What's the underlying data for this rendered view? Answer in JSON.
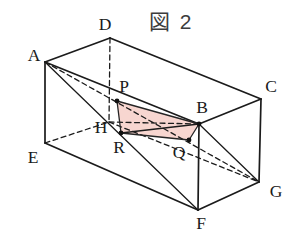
{
  "figure": {
    "title": "図 2"
  },
  "colors": {
    "background": "#ffffff",
    "line": "#1b1b1b",
    "label": "#1a1a1a",
    "title_color": "#3c3c3c",
    "section_fill": "#f6d2cb",
    "section_stroke": "#252525",
    "dot": "#111111"
  },
  "diagram": {
    "canvas": {
      "width": 290,
      "height": 236
    },
    "vertices": {
      "A": [
        45,
        62
      ],
      "B": [
        199,
        124
      ],
      "C": [
        261,
        99
      ],
      "D": [
        110,
        38
      ],
      "E": [
        45,
        143
      ],
      "F": [
        198,
        210
      ],
      "G": [
        259,
        182
      ],
      "H": [
        109,
        122
      ]
    },
    "points": {
      "P": [
        117,
        101
      ],
      "Q": [
        189,
        140
      ],
      "R": [
        121,
        133
      ]
    },
    "solid_edges": [
      [
        "A",
        "D"
      ],
      [
        "D",
        "C"
      ],
      [
        "C",
        "G"
      ],
      [
        "G",
        "F"
      ],
      [
        "F",
        "E"
      ],
      [
        "E",
        "A"
      ],
      [
        "A",
        "B"
      ],
      [
        "B",
        "C"
      ],
      [
        "B",
        "F"
      ]
    ],
    "dashed_edges": [
      [
        "D",
        "H"
      ],
      [
        "E",
        "H"
      ],
      [
        "H",
        "G"
      ]
    ],
    "solid_diagonals": [
      [
        "A",
        "F"
      ],
      [
        "B",
        "G"
      ],
      [
        "R",
        "B"
      ]
    ],
    "dashed_diagonals": [
      [
        "A",
        "G"
      ],
      [
        "H",
        "B"
      ]
    ],
    "shaded_quad": [
      "P",
      "B",
      "Q",
      "R"
    ],
    "dots": [
      "P",
      "Q",
      "R",
      "B"
    ],
    "labels": [
      {
        "text": "A",
        "x": 34,
        "y": 55
      },
      {
        "text": "D",
        "x": 105,
        "y": 24
      },
      {
        "text": "C",
        "x": 271,
        "y": 86
      },
      {
        "text": "B",
        "x": 202,
        "y": 107
      },
      {
        "text": "E",
        "x": 33,
        "y": 157
      },
      {
        "text": "H",
        "x": 101,
        "y": 127
      },
      {
        "text": "P",
        "x": 124,
        "y": 86
      },
      {
        "text": "R",
        "x": 119,
        "y": 147
      },
      {
        "text": "Q",
        "x": 179,
        "y": 152
      },
      {
        "text": "F",
        "x": 201,
        "y": 223
      },
      {
        "text": "G",
        "x": 276,
        "y": 191
      }
    ],
    "style": {
      "edge_width": 1.7,
      "diagonal_width": 1.3,
      "dash_pattern": "5,3.5",
      "dot_radius": 2.4
    }
  }
}
